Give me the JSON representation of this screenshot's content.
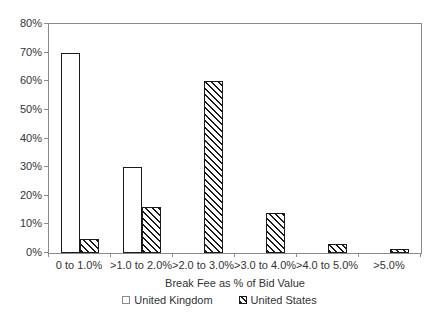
{
  "chart_data": {
    "type": "bar",
    "title": "",
    "xlabel": "Break Fee as % of Bid Value",
    "ylabel": "",
    "categories": [
      "0 to 1.0%",
      ">1.0 to 2.0%",
      ">2.0 to 3.0%",
      ">3.0 to 4.0%",
      ">4.0 to 5.0%",
      ">5.0%"
    ],
    "series": [
      {
        "name": "United Kingdom",
        "pattern": "solid-white",
        "values": [
          70,
          30,
          0,
          0,
          0,
          0
        ]
      },
      {
        "name": "United States",
        "pattern": "diagonal-hatch",
        "values": [
          5,
          16,
          60,
          14,
          3,
          1.5
        ]
      }
    ],
    "ylim": [
      0,
      80
    ],
    "ytick_step": 10,
    "ytick_suffix": "%",
    "grid": false,
    "legend_position": "bottom",
    "colors": {
      "background": "#ffffff",
      "axis_line": "#8a8a8a",
      "bar_border": "#1a1a1a",
      "hatch": "#1a1a1a",
      "text": "#333333"
    }
  }
}
